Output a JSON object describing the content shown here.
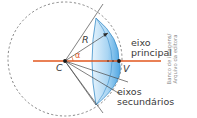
{
  "diagram": {
    "labels": {
      "center": "C",
      "vertex": "V",
      "radius": "R",
      "angle": "α",
      "principal_axis_line1": "eixo",
      "principal_axis_line2": "principal",
      "secondary_axes_line1": "eixos",
      "secondary_axes_line2": "secundários"
    },
    "credit_line1": "Banco de imagens/",
    "credit_line2": "Arquivo da editora",
    "colors": {
      "principal_axis": "#e2571e",
      "cap_fill_light": "#dbeefb",
      "cap_fill_dark": "#5aaee6",
      "cap_stroke": "#3d8fc9",
      "lines": "#4a4a4a",
      "dashed_circle": "#6a6a6a"
    },
    "points": {
      "C": [
        65,
        61
      ],
      "V": [
        119,
        61
      ]
    }
  }
}
